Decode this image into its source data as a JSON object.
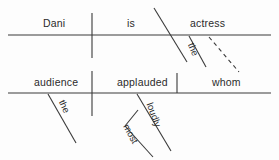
{
  "diagram": {
    "type": "reed-kellogg-sentence-diagram",
    "sentence": "Dani is the actress whom the audience applauded most loudly",
    "ink_color": "#3a3a3a",
    "background_color": "#fdfdfd",
    "main_clause": {
      "subject": "Dani",
      "verb": "is",
      "predicate_nominative": "actress",
      "article_modifier": "the"
    },
    "relative_clause": {
      "subject": "audience",
      "verb": "applauded",
      "direct_object": "whom",
      "article_modifier": "the",
      "adverb": "loudly",
      "adverb_modifier": "most"
    },
    "connector": {
      "style": "dashed",
      "from": "actress",
      "to": "whom"
    }
  },
  "words": {
    "dani": "Dani",
    "is": "is",
    "actress": "actress",
    "the_top": "the",
    "audience": "audience",
    "applauded": "applauded",
    "whom": "whom",
    "the_bottom": "the",
    "loudly": "loudly",
    "most": "most"
  }
}
